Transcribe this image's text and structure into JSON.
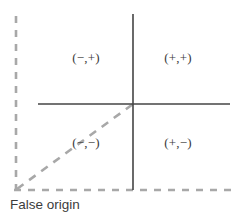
{
  "diagram": {
    "caption": "False origin",
    "quadrants": {
      "top_left": "(−,+)",
      "top_right": "(+,+)",
      "bottom_left": "(−,−)",
      "bottom_right": "(+,−)"
    },
    "colors": {
      "axis": "#444444",
      "dashed": "#a8a8a8",
      "label_text": "#3a3a3a",
      "caption_text": "#3c3c3c",
      "background": "#ffffff"
    },
    "geometry": {
      "true_origin_x": 133,
      "true_origin_y": 104,
      "false_origin_x": 16,
      "false_origin_y": 190,
      "x_axis_start_x": 38,
      "x_axis_end_x": 230,
      "y_axis_start_y": 14,
      "y_axis_end_y": 190,
      "dashed_vertical_top_y": 16
    }
  }
}
